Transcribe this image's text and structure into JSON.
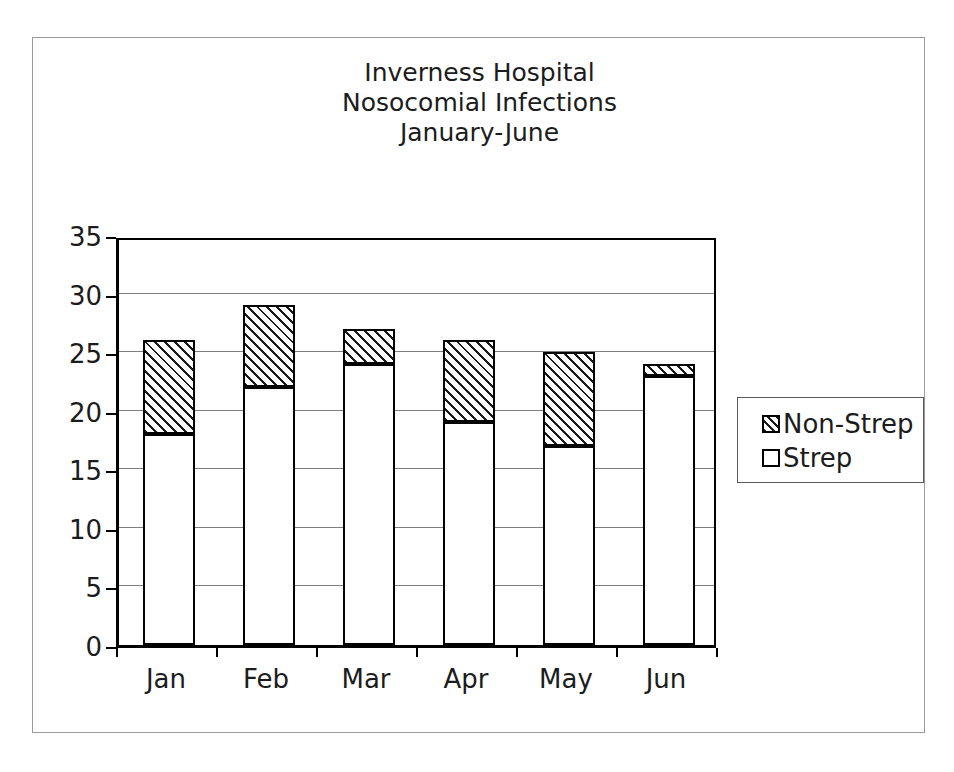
{
  "chart_data": {
    "type": "bar",
    "subtype": "stacked-column",
    "title": "Inverness Hospital Nosocomial Infections January-June",
    "title_lines": [
      "Inverness Hospital",
      "Nosocomial Infections",
      "January-June"
    ],
    "categories": [
      "Jan",
      "Feb",
      "Mar",
      "Apr",
      "May",
      "Jun"
    ],
    "series": [
      {
        "name": "Strep",
        "values": [
          18,
          22,
          24,
          19,
          17,
          23
        ],
        "fill": "white",
        "swatch": "strep-swatch"
      },
      {
        "name": "Non-Strep",
        "values": [
          8,
          7,
          3,
          7,
          8,
          1
        ],
        "fill": "hatched",
        "swatch": "non-strep-swatch"
      }
    ],
    "totals": [
      26,
      29,
      27,
      26,
      25,
      24
    ],
    "stack_order": [
      "Strep",
      "Non-Strep"
    ],
    "xlabel": "",
    "ylabel": "",
    "ylim": [
      0,
      35
    ],
    "ytick_values": [
      0,
      5,
      10,
      15,
      20,
      25,
      30,
      35
    ],
    "ytick_labels": [
      "0",
      "5",
      "10",
      "15",
      "20",
      "25",
      "30",
      "35"
    ],
    "grid": true,
    "grid_axis": "y",
    "legend_position": "right",
    "legend_entries": [
      "Non-Strep",
      "Strep"
    ],
    "colors": {
      "axis": "#000000",
      "gridline": "#7d7d7d",
      "text": "#1c1c1c",
      "strep_fill": "#ffffff",
      "non_strep_fill": "#ffffff",
      "non_strep_hatch": "#1a1a1a",
      "frame": "#9a9a9a",
      "background": "#ffffff"
    }
  }
}
